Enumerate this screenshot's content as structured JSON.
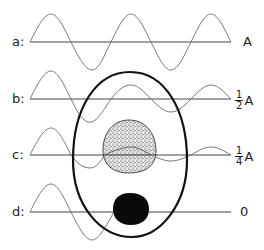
{
  "diagram": {
    "type": "wave-absorption-cell",
    "rows": [
      {
        "id": "a",
        "left_label": "a:",
        "right_label": "A",
        "axis_y": 42,
        "fraction": null
      },
      {
        "id": "b",
        "left_label": "b:",
        "right_label": "A",
        "axis_y": 99,
        "fraction": {
          "num": "1",
          "den": "2"
        }
      },
      {
        "id": "c",
        "left_label": "c:",
        "right_label": "A",
        "axis_y": 155,
        "fraction": {
          "num": "1",
          "den": "4"
        }
      },
      {
        "id": "d",
        "left_label": "d:",
        "right_label": "0",
        "axis_y": 212,
        "fraction": null
      }
    ],
    "shapes": {
      "cell": {
        "description": "egg-shaped cell outline",
        "stroke": "#111111"
      },
      "stippled_nucleus": {
        "description": "stippled (partially absorbing) nucleus",
        "fill": "#9a9a9a"
      },
      "black_nucleus": {
        "description": "solid black (fully absorbing) body",
        "fill": "#0a0a0a"
      }
    },
    "colors": {
      "wave": "#777777",
      "axis": "#444444",
      "outline": "#111111",
      "text": "#222222"
    }
  }
}
